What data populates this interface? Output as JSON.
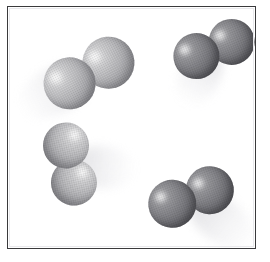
{
  "figure": {
    "background_color": "#ffffff",
    "frame": {
      "label": "gas container",
      "border_color": "#3a3a3c",
      "fill_color": "#ffffff",
      "x": 7,
      "y": 6,
      "width": 249,
      "height": 243
    },
    "molecule_type": "diatomic",
    "atoms_per_molecule": 2,
    "molecule_count": 4,
    "shading_colors": {
      "light_atom": "#b8b8bb",
      "dark_atom": "#6e6e73",
      "highlight": "#ffffff",
      "trail": "#d8d8dc"
    },
    "molecules": [
      {
        "id": "molecule-top-left",
        "shade": "light",
        "center_x": 88,
        "center_y": 72,
        "atom_radius": 26,
        "bond_offset": 22,
        "axis_angle_deg": -28,
        "trail_angle_deg": 152,
        "trail_length": 78,
        "trail_width": 46
      },
      {
        "id": "molecule-top-right",
        "shade": "dark",
        "center_x": 213,
        "center_y": 48,
        "atom_radius": 23,
        "bond_offset": 19,
        "axis_angle_deg": -22,
        "trail_angle_deg": 118,
        "trail_length": 62,
        "trail_width": 40
      },
      {
        "id": "molecule-bottom-left",
        "shade": "light",
        "center_x": 69,
        "center_y": 163,
        "atom_radius": 23,
        "bond_offset": 19,
        "axis_angle_deg": 78,
        "trail_angle_deg": 6,
        "trail_length": 66,
        "trail_width": 42
      },
      {
        "id": "molecule-bottom-right",
        "shade": "dark",
        "center_x": 190,
        "center_y": 196,
        "atom_radius": 24,
        "bond_offset": 20,
        "axis_angle_deg": -20,
        "trail_angle_deg": 38,
        "trail_length": 78,
        "trail_width": 44
      }
    ]
  }
}
